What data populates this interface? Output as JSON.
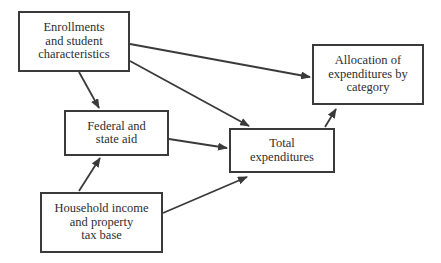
{
  "diagram": {
    "type": "flowchart",
    "nodes": [
      {
        "id": "enrollments",
        "lines": [
          "Enrollments",
          "and student",
          "characteristics"
        ]
      },
      {
        "id": "aid",
        "lines": [
          "Federal and",
          "state aid"
        ]
      },
      {
        "id": "household",
        "lines": [
          "Household income",
          "and property",
          "tax base"
        ]
      },
      {
        "id": "total",
        "lines": [
          "Total",
          "expenditures"
        ]
      },
      {
        "id": "allocation",
        "lines": [
          "Allocation of",
          "expenditures by",
          "category"
        ]
      }
    ],
    "edges": [
      {
        "from": "enrollments",
        "to": "aid"
      },
      {
        "from": "enrollments",
        "to": "total"
      },
      {
        "from": "enrollments",
        "to": "allocation"
      },
      {
        "from": "aid",
        "to": "total"
      },
      {
        "from": "household",
        "to": "aid"
      },
      {
        "from": "household",
        "to": "total"
      },
      {
        "from": "total",
        "to": "allocation"
      }
    ],
    "colors": {
      "stroke": "#3a3a3a",
      "text": "#2e2e2e",
      "background": "#ffffff"
    }
  }
}
